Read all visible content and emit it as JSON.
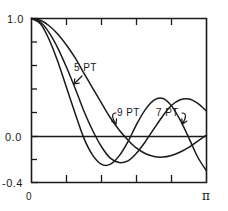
{
  "figure": {
    "name": "filter-frequency-response",
    "background": "#ffffff",
    "ink": "#1a1a1a"
  },
  "chart_data": {
    "type": "line",
    "title": "",
    "subtitle": "",
    "xlabel": "",
    "ylabel": "",
    "xlim": [
      0,
      3.14159
    ],
    "ylim": [
      -0.4,
      1.0
    ],
    "grid": false,
    "legend_position": "inline-annotations",
    "x_tick_labels": [
      "0",
      "π"
    ],
    "x_tick_values": [
      0,
      3.14159
    ],
    "x_minor_tick_count": 4,
    "y_tick_labels": [
      "1.0",
      "0.0",
      "-0.4"
    ],
    "y_tick_values": [
      1.0,
      0.0,
      -0.4
    ],
    "y_minor_tick_count": 6,
    "zero_line": true,
    "annotations": [
      {
        "id": "a5",
        "text": "5 PT",
        "x": 1.18,
        "y": 0.58,
        "points_to_series": "5 PT"
      },
      {
        "id": "a9",
        "text": "9 PT",
        "x": 1.88,
        "y": 0.16,
        "points_to_series": "9 PT"
      },
      {
        "id": "a7",
        "text": "7 PT",
        "x": 2.48,
        "y": 0.16,
        "points_to_series": "7 PT"
      }
    ],
    "series": [
      {
        "name": "5 PT",
        "color": "#1a1a1a",
        "x": [
          0.0,
          0.16,
          0.31,
          0.47,
          0.63,
          0.79,
          0.94,
          1.1,
          1.26,
          1.41,
          1.57,
          1.73,
          1.88,
          2.04,
          2.2,
          2.36,
          2.51,
          2.67,
          2.83,
          2.98,
          3.14
        ],
        "values": [
          1.0,
          0.985,
          0.94,
          0.868,
          0.772,
          0.659,
          0.534,
          0.404,
          0.276,
          0.157,
          0.051,
          -0.037,
          -0.105,
          -0.152,
          -0.178,
          -0.183,
          -0.169,
          -0.14,
          -0.098,
          -0.048,
          0.005
        ]
      },
      {
        "name": "7 PT",
        "color": "#1a1a1a",
        "x": [
          0.0,
          0.16,
          0.31,
          0.47,
          0.63,
          0.79,
          0.94,
          1.1,
          1.26,
          1.41,
          1.57,
          1.73,
          1.88,
          2.04,
          2.2,
          2.36,
          2.51,
          2.67,
          2.83,
          2.98,
          3.14
        ],
        "values": [
          1.0,
          0.97,
          0.884,
          0.75,
          0.582,
          0.396,
          0.211,
          0.042,
          -0.097,
          -0.19,
          -0.23,
          -0.215,
          -0.152,
          -0.054,
          0.06,
          0.17,
          0.257,
          0.307,
          0.313,
          0.277,
          0.21
        ]
      },
      {
        "name": "9 PT",
        "color": "#1a1a1a",
        "x": [
          0.0,
          0.16,
          0.31,
          0.47,
          0.63,
          0.79,
          0.94,
          1.1,
          1.26,
          1.41,
          1.57,
          1.73,
          1.88,
          2.04,
          2.2,
          2.36,
          2.51,
          2.67,
          2.83,
          2.98,
          3.14
        ],
        "values": [
          1.0,
          0.955,
          0.827,
          0.635,
          0.408,
          0.18,
          -0.021,
          -0.168,
          -0.245,
          -0.245,
          -0.175,
          -0.053,
          0.09,
          0.22,
          0.303,
          0.317,
          0.256,
          0.132,
          -0.025,
          -0.18,
          -0.3
        ]
      }
    ]
  },
  "labels": {
    "y_max": "1.0",
    "y_zero": "0.0",
    "y_min": "-0.4",
    "x_zero": "0",
    "x_max": "π",
    "curve_5pt": "5 PT",
    "curve_9pt": "9 PT",
    "curve_7pt": "7 PT"
  }
}
